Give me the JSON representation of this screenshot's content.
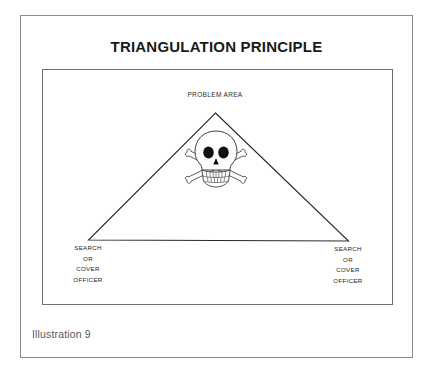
{
  "figure": {
    "title": "TRIANGULATION PRINCIPLE",
    "caption": "Illustration 9",
    "background_color": "#ffffff",
    "outer_border_color": "#8b8b8b",
    "inner_border_color": "#6f6f6f",
    "line_color": "#2a2a2a",
    "text_color": "#1e1e1e"
  },
  "diagram": {
    "type": "triangle-schematic",
    "apex_label": "PROBLEM AREA",
    "center_icon": "skull-and-crossbones-icon",
    "vertices": [
      {
        "position": "apex",
        "label_lines": [
          "PROBLEM AREA"
        ]
      },
      {
        "position": "bottom-left",
        "label_lines": [
          "SEARCH",
          "OR",
          "COVER",
          "OFFICER"
        ]
      },
      {
        "position": "bottom-right",
        "label_lines": [
          "SEARCH",
          "OR",
          "COVER",
          "OFFICER"
        ]
      }
    ],
    "left_vertex": {
      "line1": "SEARCH",
      "line2": "OR",
      "line3": "COVER",
      "line4": "OFFICER"
    },
    "right_vertex": {
      "line1": "SEARCH",
      "line2": "OR",
      "line3": "COVER",
      "line4": "OFFICER"
    }
  }
}
